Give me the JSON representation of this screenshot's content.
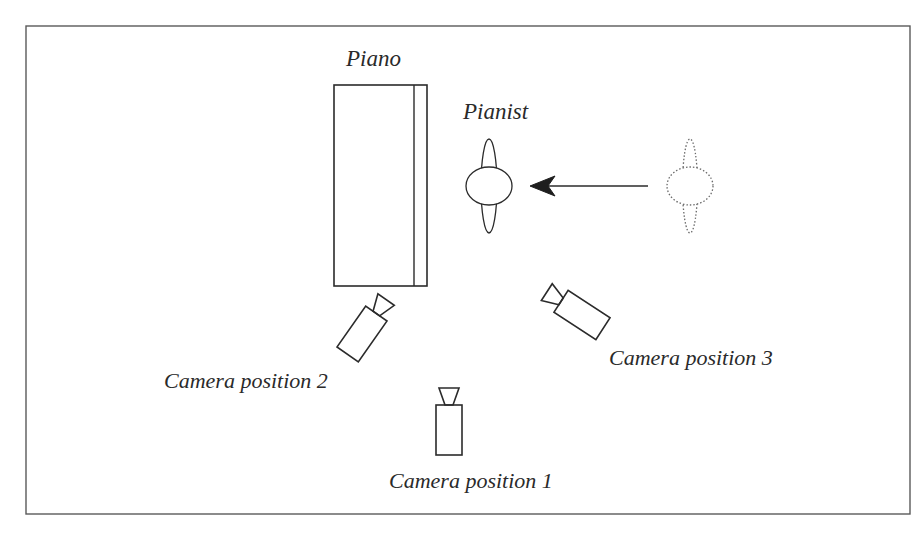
{
  "diagram": {
    "type": "studio camera setup",
    "colors": {
      "line": "#2b2b2b",
      "frame": "#5a5a5a",
      "dotted": "#6a6a6a",
      "background": "#ffffff"
    },
    "labels": {
      "piano": "Piano",
      "pianist": "Pianist",
      "camera_1": "Camera position 1",
      "camera_2": "Camera position 2",
      "camera_3": "Camera position 3"
    },
    "nodes": [
      {
        "id": "piano",
        "shape": "rectangle",
        "label": "Piano"
      },
      {
        "id": "pianist",
        "shape": "figure-top-view",
        "label": "Pianist"
      },
      {
        "id": "pianist-previous",
        "shape": "figure-top-view-dotted",
        "label": ""
      },
      {
        "id": "camera-1",
        "shape": "camera-icon",
        "label": "Camera position 1"
      },
      {
        "id": "camera-2",
        "shape": "camera-icon",
        "label": "Camera position 2"
      },
      {
        "id": "camera-3",
        "shape": "camera-icon",
        "label": "Camera position 3"
      }
    ],
    "edges": [
      {
        "from": "pianist-previous",
        "to": "pianist",
        "style": "arrow"
      }
    ]
  }
}
